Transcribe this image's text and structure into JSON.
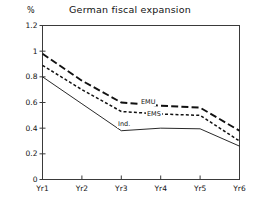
{
  "chart_data": {
    "type": "line",
    "title": "German fiscal expansion",
    "xlabel": "",
    "ylabel": "%",
    "y_unit_label": "%",
    "categories": [
      "Yr1",
      "Yr2",
      "Yr3",
      "Yr4",
      "Yr5",
      "Yr6"
    ],
    "ylim": [
      0,
      1.2
    ],
    "xlim": [
      1,
      6
    ],
    "yticks": [
      0,
      0.2,
      0.4,
      0.6,
      0.8,
      1,
      1.2
    ],
    "ytick_labels": [
      "0",
      "0.2",
      "0.4",
      "0.6",
      "0.8",
      "1",
      "1.2"
    ],
    "xtick_labels": [
      "Yr1",
      "Yr2",
      "Yr3",
      "Yr4",
      "Yr5",
      "Yr6"
    ],
    "grid": false,
    "frame": "box",
    "legend_position": "inline-annotations",
    "series": [
      {
        "name": "EMU",
        "label": "EMU",
        "style": "long-dash",
        "width": 1.9,
        "color": "#111111",
        "values": [
          0.98,
          0.77,
          0.6,
          0.575,
          0.56,
          0.38
        ],
        "annotation_at": "Yr3"
      },
      {
        "name": "EMS",
        "label": "EMS",
        "style": "short-dash",
        "width": 1.5,
        "color": "#111111",
        "values": [
          0.89,
          0.7,
          0.53,
          0.51,
          0.5,
          0.3
        ],
        "annotation_at": "Yr3-Yr4"
      },
      {
        "name": "Ind.",
        "label": "Ind.",
        "style": "solid",
        "width": 0.9,
        "color": "#111111",
        "values": [
          0.8,
          0.59,
          0.38,
          0.4,
          0.395,
          0.26
        ],
        "annotation_at": "Yr3"
      }
    ],
    "annotations": [
      {
        "text": "EMU",
        "x_px": 140,
        "y_px": 99
      },
      {
        "text": "EMS",
        "x_px": 146,
        "y_px": 111
      },
      {
        "text": "Ind.",
        "x_px": 117,
        "y_px": 121
      }
    ],
    "colors": {
      "axis": "#3a3a3a",
      "line": "#111111",
      "background": "#ffffff"
    }
  }
}
